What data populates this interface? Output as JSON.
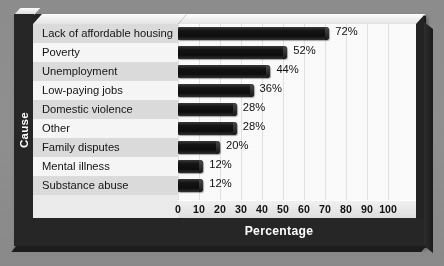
{
  "chart_data": {
    "type": "bar",
    "orientation": "horizontal",
    "title": "",
    "xlabel": "Percentage",
    "ylabel": "Cause",
    "categories": [
      "Lack of affordable housing",
      "Poverty",
      "Unemployment",
      "Low-paying jobs",
      "Domestic violence",
      "Other",
      "Family disputes",
      "Mental illness",
      "Substance abuse"
    ],
    "values": [
      72,
      52,
      44,
      36,
      28,
      28,
      20,
      12,
      12
    ],
    "data_labels": [
      "72%",
      "52%",
      "44%",
      "36%",
      "28%",
      "28%",
      "20%",
      "12%",
      "12%"
    ],
    "xlim": [
      0,
      100
    ],
    "xticks": [
      0,
      10,
      20,
      30,
      40,
      50,
      60,
      70,
      80,
      90,
      100
    ],
    "xtick_labels": [
      "0",
      "10",
      "20",
      "30",
      "40",
      "50",
      "60",
      "70",
      "80",
      "90",
      "100"
    ],
    "grid": "vertical",
    "legend": "none",
    "bar_color": "#121212",
    "plot_background": "#fbfbfb",
    "frame_color": "#262626",
    "page_background": "#8e8e8e",
    "band_color": "#dcdcdc"
  }
}
